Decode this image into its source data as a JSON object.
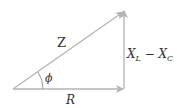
{
  "diagram": {
    "type": "impedance-triangle",
    "labels": {
      "hypotenuse": "Z",
      "angle": "ϕ",
      "base": "R",
      "vertical_main": "X",
      "vertical_sub1": "L",
      "vertical_minus": " − ",
      "vertical_main2": "X",
      "vertical_sub2": "C"
    },
    "colors": {
      "line": "#b3b3b3",
      "text": "#333333"
    }
  }
}
